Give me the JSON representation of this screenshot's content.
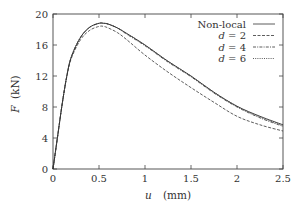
{
  "chart_data": {
    "type": "line",
    "title": "",
    "xlabel": "u  (mm)",
    "xlabel_var": "u",
    "xlabel_unit": "(mm)",
    "ylabel": "F (kN)",
    "ylabel_var": "F",
    "ylabel_unit": "(kN)",
    "xlim": [
      0,
      2.5
    ],
    "ylim": [
      0,
      20
    ],
    "xticks": [
      0,
      0.5,
      1,
      1.5,
      2,
      2.5
    ],
    "xtick_labels": [
      "0",
      "0.5",
      "1",
      "1.5",
      "2",
      "2.5"
    ],
    "yticks": [
      0,
      4,
      8,
      12,
      16,
      20
    ],
    "ytick_labels": [
      "0",
      "4",
      "8",
      "12",
      "16",
      "20"
    ],
    "grid": false,
    "legend_position": "upper right",
    "series": [
      {
        "name": "Non-local",
        "style": "solid",
        "x": [
          0,
          0.05,
          0.1,
          0.15,
          0.2,
          0.3,
          0.4,
          0.5,
          0.55,
          0.6,
          0.7,
          0.8,
          1.0,
          1.25,
          1.5,
          1.75,
          2.0,
          2.25,
          2.5
        ],
        "y": [
          0,
          4.2,
          8.4,
          12.0,
          14.5,
          17.0,
          18.3,
          18.8,
          18.8,
          18.7,
          18.2,
          17.5,
          16.0,
          13.9,
          12.0,
          9.9,
          8.1,
          6.8,
          5.7
        ]
      },
      {
        "name": "d = 2",
        "style": "dashed",
        "x": [
          0,
          0.05,
          0.1,
          0.15,
          0.2,
          0.3,
          0.4,
          0.5,
          0.55,
          0.6,
          0.7,
          0.8,
          1.0,
          1.25,
          1.5,
          1.75,
          2.0,
          2.25,
          2.5
        ],
        "y": [
          0,
          4.2,
          8.4,
          11.9,
          14.3,
          16.7,
          17.9,
          18.4,
          18.4,
          18.2,
          17.6,
          16.7,
          14.7,
          12.5,
          10.5,
          8.6,
          6.8,
          5.7,
          4.9
        ]
      },
      {
        "name": "d = 4",
        "style": "dash-dot",
        "x": [
          0,
          0.05,
          0.1,
          0.15,
          0.2,
          0.3,
          0.4,
          0.5,
          0.55,
          0.6,
          0.7,
          0.8,
          1.0,
          1.25,
          1.5,
          1.75,
          2.0,
          2.25,
          2.5
        ],
        "y": [
          0,
          4.2,
          8.4,
          12.0,
          14.5,
          17.0,
          18.3,
          18.8,
          18.8,
          18.7,
          18.2,
          17.4,
          15.9,
          13.8,
          11.9,
          9.8,
          8.0,
          6.6,
          5.5
        ]
      },
      {
        "name": "d = 6",
        "style": "dotted",
        "x": [
          0,
          0.05,
          0.1,
          0.15,
          0.2,
          0.3,
          0.4,
          0.5,
          0.55,
          0.6,
          0.7,
          0.8,
          1.0,
          1.25,
          1.5,
          1.75,
          2.0,
          2.25,
          2.5
        ],
        "y": [
          0,
          4.2,
          8.4,
          12.0,
          14.5,
          17.0,
          18.3,
          18.8,
          18.8,
          18.7,
          18.2,
          17.5,
          16.0,
          13.9,
          12.0,
          9.9,
          8.1,
          6.7,
          5.6
        ]
      }
    ]
  },
  "legend": {
    "items": [
      {
        "var": "",
        "label": "Non-local",
        "rest": ""
      },
      {
        "var": "d",
        "label": "",
        "rest": " = 2"
      },
      {
        "var": "d",
        "label": "",
        "rest": " = 4"
      },
      {
        "var": "d",
        "label": "",
        "rest": " = 6"
      }
    ]
  },
  "colors": {
    "line": "#333333",
    "axis": "#444444",
    "background": "#ffffff"
  }
}
